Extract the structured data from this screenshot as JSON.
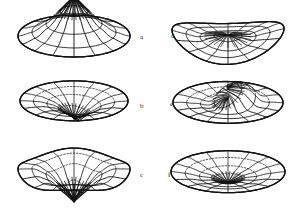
{
  "figure": {
    "caption_visible": false,
    "background_color": "#ffffff",
    "ink_color": "#111111",
    "layout": {
      "rows": 3,
      "cols": 2,
      "panel_count": 6
    }
  },
  "chart_data": {
    "type": "line",
    "title": "",
    "subtitle": "",
    "xlabel": "",
    "ylabel": "",
    "grid": false,
    "legend_position": "none",
    "projection": "3d-polar-wireframe",
    "common": {
      "radial_rings": 4,
      "angular_spokes": 16,
      "ellipse_flatten": 0.36,
      "domain_radius": 1.0,
      "r_ticks": [
        0.25,
        0.5,
        0.75,
        1.0
      ],
      "theta_ticks_deg": [
        0,
        22.5,
        45,
        67.5,
        90,
        112.5,
        135,
        157.5,
        180,
        202.5,
        225,
        247.5,
        270,
        292.5,
        315,
        337.5
      ]
    },
    "panels": [
      {
        "label": "a",
        "label_x": 140,
        "label_y": 34,
        "center_x": 74,
        "center_y": 36,
        "rx": 56,
        "ry": 21,
        "shape": "dome",
        "peak_height": 26,
        "peak_offset_x": 0.0,
        "peak_offset_y": 0.0,
        "sign": "positive",
        "zlim": [
          0,
          1.0
        ],
        "values_r": [
          1.0,
          0.78,
          0.46,
          0.18,
          0.0
        ],
        "note": "Smooth axisymmetric dome, single central maximum, steep dark apex"
      },
      {
        "label": "b",
        "label_x": 140,
        "label_y": 103,
        "center_x": 74,
        "center_y": 101,
        "rx": 54,
        "ry": 20,
        "shape": "funnel",
        "peak_height": 15,
        "peak_offset_x": 0.08,
        "peak_offset_y": 0.0,
        "sign": "negative",
        "zlim": [
          -0.7,
          0.15
        ],
        "values_r": [
          -0.7,
          -0.46,
          -0.2,
          -0.04,
          0.02
        ],
        "note": "Shallow disc with narrow central depression; spokes converge into dark funnel"
      },
      {
        "label": "c",
        "label_x": 140,
        "label_y": 172,
        "center_x": 74,
        "center_y": 172,
        "rx": 56,
        "ry": 21,
        "shape": "crater",
        "peak_height": 19,
        "peak_offset_x": 0.0,
        "peak_offset_y": 0.0,
        "sign": "negative",
        "zlim": [
          -0.9,
          0.25
        ],
        "values_r": [
          -0.88,
          -0.6,
          -0.18,
          0.12,
          0.1
        ],
        "note": "Deep wide central crater with raised rim; hidden rim arcs dashed"
      },
      {
        "label": "d",
        "label_x": 171,
        "label_y": 33,
        "center_x": 228,
        "center_y": 37,
        "rx": 56,
        "ry": 21,
        "shape": "saddle",
        "peak_height": 13,
        "peak_offset_x": -0.06,
        "peak_offset_y": 0.05,
        "sign": "mixed",
        "zlim": [
          -0.55,
          0.55
        ],
        "values_r": [
          0.3,
          0.12,
          -0.25,
          -0.1,
          0.05
        ],
        "note": "Flattened ellipse with asymmetric saddle warp crossing the centre"
      },
      {
        "label": "e",
        "label_x": 170,
        "label_y": 101,
        "center_x": 228,
        "center_y": 103,
        "rx": 55,
        "ry": 21,
        "shape": "fold",
        "peak_height": 16,
        "peak_offset_x": 0.14,
        "peak_offset_y": -0.1,
        "sign": "mixed",
        "zlim": [
          -0.6,
          0.6
        ],
        "values_r": [
          0.2,
          0.45,
          -0.3,
          -0.05,
          0.08
        ],
        "note": "Off-centre bulge folding over the interior rings; strong dark fold lines"
      },
      {
        "label": "f",
        "label_x": 168,
        "label_y": 172,
        "center_x": 228,
        "center_y": 172,
        "rx": 57,
        "ry": 21,
        "shape": "cusp",
        "peak_height": 11,
        "peak_offset_x": 0.0,
        "peak_offset_y": 0.0,
        "sign": "negative",
        "zlim": [
          -0.45,
          0.3
        ],
        "values_r": [
          -0.05,
          -0.22,
          -0.4,
          -0.15,
          0.05
        ],
        "note": "Wide shallow ellipse, spokes converge to a dark cusp slightly left of centre"
      }
    ]
  }
}
